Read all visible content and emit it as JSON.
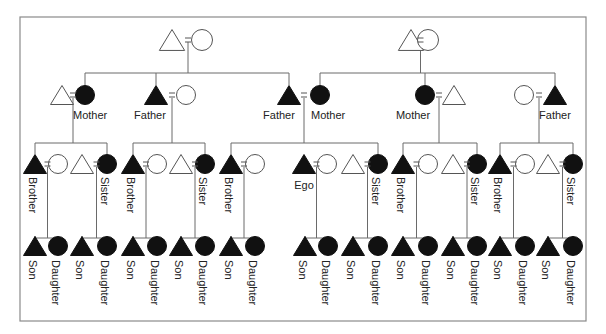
{
  "diagram": {
    "frame": {
      "x": 20,
      "y": 17,
      "w": 566,
      "h": 304
    },
    "legend": {
      "triangle": "male",
      "circle": "female",
      "equals": "marriage",
      "filled": "consanguineal kin in focus"
    },
    "generations": [
      {
        "level": 1,
        "couples": [
          {
            "id": "gp-left",
            "left": {
              "shape": "triangle",
              "filled": false,
              "x": 172,
              "y": 40
            },
            "right": {
              "shape": "circle",
              "filled": false,
              "x": 202,
              "y": 40
            }
          },
          {
            "id": "gp-right",
            "left": {
              "shape": "triangle",
              "filled": false,
              "x": 411,
              "y": 40
            },
            "right": {
              "shape": "circle",
              "filled": false,
              "x": 428,
              "y": 40
            }
          }
        ]
      }
    ],
    "nodes_gen2": [
      {
        "id": "m1-husband",
        "shape": "triangle",
        "filled": false,
        "x": 62,
        "y": 95
      },
      {
        "id": "m1",
        "shape": "circle",
        "filled": true,
        "x": 85,
        "y": 95,
        "label": "Mother"
      },
      {
        "id": "f1",
        "shape": "triangle",
        "filled": true,
        "x": 156,
        "y": 95,
        "label": "Father"
      },
      {
        "id": "f1-wife",
        "shape": "circle",
        "filled": false,
        "x": 186,
        "y": 95
      },
      {
        "id": "ego-father",
        "shape": "triangle",
        "filled": true,
        "x": 289,
        "y": 95,
        "label": "Father"
      },
      {
        "id": "ego-mother",
        "shape": "circle",
        "filled": true,
        "x": 320,
        "y": 95,
        "label": "Mother"
      },
      {
        "id": "m2",
        "shape": "circle",
        "filled": true,
        "x": 425,
        "y": 95,
        "label": "Mother"
      },
      {
        "id": "m2-husband",
        "shape": "triangle",
        "filled": false,
        "x": 454,
        "y": 95
      },
      {
        "id": "f2-wife",
        "shape": "circle",
        "filled": false,
        "x": 524,
        "y": 95
      },
      {
        "id": "f2",
        "shape": "triangle",
        "filled": true,
        "x": 555,
        "y": 95,
        "label": "Father"
      }
    ],
    "marriages_gen2": [
      {
        "a": "m1-husband",
        "b": "m1",
        "eq_x": 73
      },
      {
        "a": "f1",
        "b": "f1-wife",
        "eq_x": 172
      },
      {
        "a": "ego-father",
        "b": "ego-mother",
        "eq_x": 304
      },
      {
        "a": "m2",
        "b": "m2-husband",
        "eq_x": 439
      },
      {
        "a": "f2-wife",
        "b": "f2",
        "eq_x": 539
      }
    ],
    "sibling_groups": [
      {
        "brother_x": 35,
        "wife_x": 58,
        "husband_x": 82,
        "sister_x": 107,
        "brother_label": "Brother",
        "sister_label": "Sister",
        "parent_drop_x": 73
      },
      {
        "brother_x": 133,
        "wife_x": 157,
        "husband_x": 181,
        "sister_x": 205,
        "brother_label": "Brother",
        "sister_label": "Sister",
        "parent_drop_x": 172
      },
      {
        "brother_x": 231,
        "wife_x": 255,
        "husband_x": null,
        "sister_x": null,
        "brother_label": "Brother",
        "sister_label": null,
        "parent_drop_x": 304
      },
      {
        "brother_x": 304,
        "wife_x": 327,
        "husband_x": 353,
        "sister_x": 378,
        "brother_label": "Ego",
        "sister_label": "Sister",
        "parent_drop_x": 304,
        "is_ego": true
      },
      {
        "brother_x": 403,
        "wife_x": 428,
        "husband_x": 453,
        "sister_x": 477,
        "brother_label": "Brother",
        "sister_label": "Sister",
        "parent_drop_x": 439
      },
      {
        "brother_x": 500,
        "wife_x": 525,
        "husband_x": 548,
        "sister_x": 573,
        "brother_label": "Brother",
        "sister_label": "Sister",
        "parent_drop_x": 539
      }
    ],
    "labels": {
      "mother": "Mother",
      "father": "Father",
      "brother": "Brother",
      "sister": "Sister",
      "ego": "Ego",
      "son": "Son",
      "daughter": "Daughter"
    },
    "children": [
      {
        "son_x": 35,
        "daughter_x": 58
      },
      {
        "son_x": 82,
        "daughter_x": 107
      },
      {
        "son_x": 133,
        "daughter_x": 157
      },
      {
        "son_x": 181,
        "daughter_x": 205
      },
      {
        "son_x": 231,
        "daughter_x": 255
      },
      {
        "son_x": 305,
        "daughter_x": 328
      },
      {
        "son_x": 353,
        "daughter_x": 378
      },
      {
        "son_x": 403,
        "daughter_x": 428
      },
      {
        "son_x": 453,
        "daughter_x": 477
      },
      {
        "son_x": 500,
        "daughter_x": 525
      },
      {
        "son_x": 548,
        "daughter_x": 573
      }
    ],
    "rows_y": {
      "gen1": 40,
      "gen2": 95,
      "gen3": 164,
      "gen4": 246,
      "bar1": 73,
      "bar2": 143,
      "bar3": 238
    },
    "colors": {
      "filled": "#111111",
      "line": "#6a6a6a",
      "frame": "#8a8a8a",
      "background": "#ffffff"
    }
  }
}
